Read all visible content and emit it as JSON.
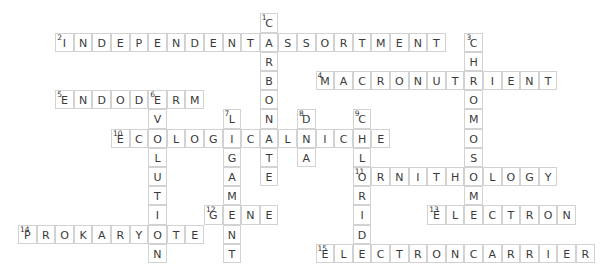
{
  "puzzle": {
    "layout": {
      "origin_x": 18,
      "origin_y": 13.4,
      "cell_w": 18.6,
      "cell_h": 19.2
    },
    "colors": {
      "border": "#d2d2d2",
      "letter": "#3a3a3a",
      "background": "#ffffff"
    },
    "words": [
      {
        "number": 1,
        "answer": "CARBONATE",
        "direction": "down",
        "col": 13,
        "row": 0
      },
      {
        "number": 2,
        "answer": "INDEPENDENTASSORTMENT",
        "direction": "across",
        "col": 2,
        "row": 1
      },
      {
        "number": 3,
        "answer": "CHROMOSOME",
        "direction": "down",
        "col": 24,
        "row": 1
      },
      {
        "number": 4,
        "answer": "MACRONUTRIENT",
        "direction": "across",
        "col": 16,
        "row": 3
      },
      {
        "number": 5,
        "answer": "ENDODERM",
        "direction": "across",
        "col": 2,
        "row": 4
      },
      {
        "number": 6,
        "answer": "EVOLUTION",
        "direction": "down",
        "col": 7,
        "row": 4
      },
      {
        "number": 7,
        "answer": "LIGAMENT",
        "direction": "down",
        "col": 11,
        "row": 5
      },
      {
        "number": 8,
        "answer": "DNA",
        "direction": "down",
        "col": 15,
        "row": 5
      },
      {
        "number": 9,
        "answer": "CHLORIDE",
        "direction": "down",
        "col": 18,
        "row": 5
      },
      {
        "number": 10,
        "answer": "ECOLOGICALNICHE",
        "direction": "across",
        "col": 5,
        "row": 6
      },
      {
        "number": 11,
        "answer": "ORNITHOLOGY",
        "direction": "across",
        "col": 18,
        "row": 8
      },
      {
        "number": 12,
        "answer": "GENE",
        "direction": "across",
        "col": 10,
        "row": 10
      },
      {
        "number": 13,
        "answer": "ELECTRON",
        "direction": "across",
        "col": 22,
        "row": 10
      },
      {
        "number": 14,
        "answer": "PROKARYOTE",
        "direction": "across",
        "col": 0,
        "row": 11
      },
      {
        "number": 15,
        "answer": "ELECTRONCARRIER",
        "direction": "across",
        "col": 16,
        "row": 12
      }
    ]
  }
}
